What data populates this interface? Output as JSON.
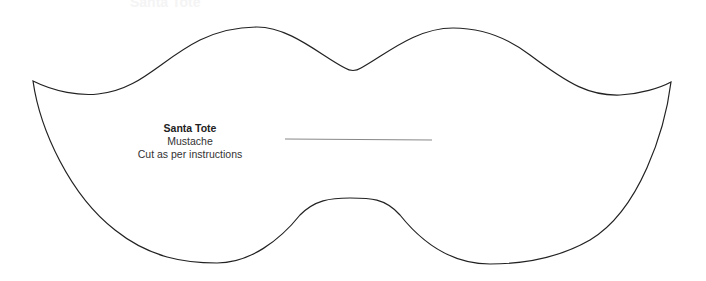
{
  "header": {
    "faint_title": "Santa Tote"
  },
  "template": {
    "title": "Santa Tote",
    "subtitle": "Mustache",
    "instructions": "Cut as per instructions"
  },
  "colors": {
    "background": "#ffffff",
    "outline": "#222222",
    "center_line": "#888888",
    "text": "#222222"
  }
}
